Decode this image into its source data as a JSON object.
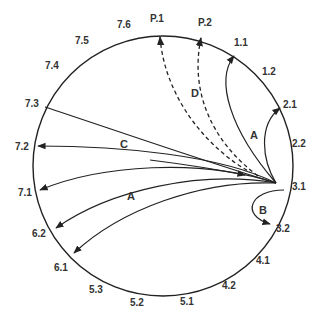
{
  "diagram": {
    "circle": {
      "cx": 163,
      "cy": 166,
      "r": 130
    },
    "node_labels": [
      {
        "id": "7.6",
        "x": 117,
        "y": 28
      },
      {
        "id": "P.1",
        "x": 150,
        "y": 22
      },
      {
        "id": "P.2",
        "x": 198,
        "y": 26
      },
      {
        "id": "1.1",
        "x": 234,
        "y": 46
      },
      {
        "id": "1.2",
        "x": 262,
        "y": 75
      },
      {
        "id": "2.1",
        "x": 283,
        "y": 108
      },
      {
        "id": "2.2",
        "x": 292,
        "y": 147
      },
      {
        "id": "3.1",
        "x": 292,
        "y": 190
      },
      {
        "id": "3.2",
        "x": 276,
        "y": 232
      },
      {
        "id": "4.1",
        "x": 256,
        "y": 264
      },
      {
        "id": "4.2",
        "x": 222,
        "y": 289
      },
      {
        "id": "5.1",
        "x": 180,
        "y": 305
      },
      {
        "id": "5.2",
        "x": 130,
        "y": 306
      },
      {
        "id": "5.3",
        "x": 89,
        "y": 293
      },
      {
        "id": "6.1",
        "x": 54,
        "y": 271
      },
      {
        "id": "6.2",
        "x": 32,
        "y": 237
      },
      {
        "id": "7.1",
        "x": 18,
        "y": 196
      },
      {
        "id": "7.2",
        "x": 15,
        "y": 150
      },
      {
        "id": "7.3",
        "x": 25,
        "y": 107
      },
      {
        "id": "7.4",
        "x": 45,
        "y": 69
      },
      {
        "id": "7.5",
        "x": 75,
        "y": 44
      }
    ],
    "arc_labels": [
      {
        "id": "A_top",
        "text": "A",
        "x": 250,
        "y": 139
      },
      {
        "id": "B",
        "text": "B",
        "x": 259,
        "y": 214
      },
      {
        "id": "C",
        "text": "C",
        "x": 120,
        "y": 148
      },
      {
        "id": "D",
        "text": "D",
        "x": 191,
        "y": 97
      },
      {
        "id": "A_bottom",
        "text": "A",
        "x": 127,
        "y": 200
      }
    ],
    "edges": [
      {
        "from": "3.1",
        "to": "1.1",
        "style": "solid",
        "label": "A"
      },
      {
        "from": "3.1",
        "to": "2.1",
        "style": "solid",
        "label": "A"
      },
      {
        "from": "3.1",
        "to": "3.2",
        "style": "solid",
        "label": "B"
      },
      {
        "from": "3.1",
        "to": "7.3",
        "style": "solid",
        "label": "C",
        "arrow": "none"
      },
      {
        "from": "3.1",
        "to": "7.2",
        "style": "solid",
        "label": "C"
      },
      {
        "from": "3.1",
        "to": "7.1",
        "style": "solid"
      },
      {
        "from": "3.1",
        "to": "6.2",
        "style": "solid",
        "label": "A"
      },
      {
        "from": "3.1",
        "to": "6.1",
        "style": "solid",
        "label": "A"
      },
      {
        "from": "3.1",
        "to": "P.1",
        "style": "dashed",
        "label": "D"
      },
      {
        "from": "3.1",
        "to": "P.2",
        "style": "dashed",
        "label": "D"
      }
    ]
  }
}
